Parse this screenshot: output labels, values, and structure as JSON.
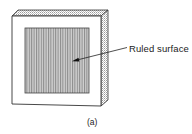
{
  "figure": {
    "type": "diffraction-grating-illustration",
    "callout": {
      "label": "Ruled surface",
      "target": "ruled-area"
    },
    "caption": "(a)",
    "colors": {
      "outline": "#333333",
      "frame_face": "#ffffff",
      "stipple_face": "#d9d9d9",
      "ruling_line": "#8a8a8a",
      "ruled_background": "#c8c8c8",
      "text": "#222222"
    }
  }
}
